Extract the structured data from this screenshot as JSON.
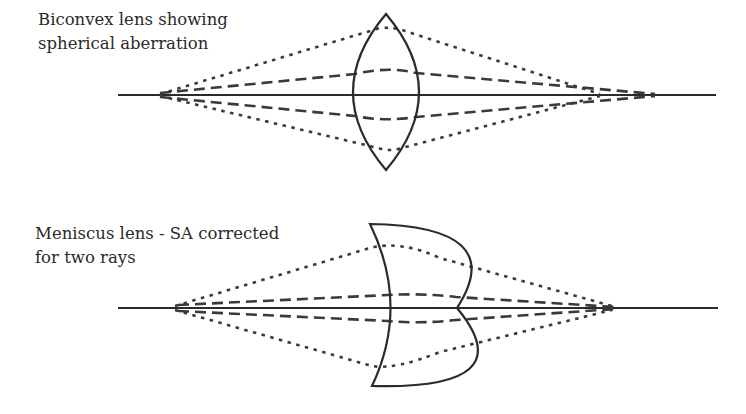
{
  "figure": {
    "panels": [
      {
        "id": "biconvex",
        "caption_lines": [
          "Biconvex lens showing",
          "spherical aberration"
        ],
        "lens_type": "biconvex",
        "rays": [
          "marginal-dotted",
          "intermediate-dashed",
          "axial-solid"
        ]
      },
      {
        "id": "meniscus",
        "caption_lines": [
          "Meniscus lens - SA corrected",
          "for two rays"
        ],
        "lens_type": "meniscus",
        "rays": [
          "marginal-dotted",
          "intermediate-dashed",
          "axial-solid"
        ]
      }
    ],
    "colors": {
      "ink": "#2b2b2b",
      "background": "#ffffff"
    }
  }
}
